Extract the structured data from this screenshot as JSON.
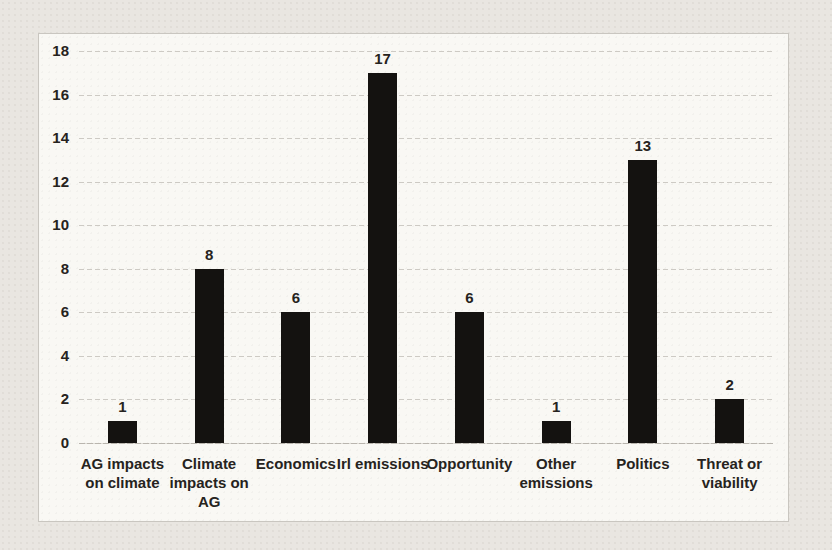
{
  "chart_data": {
    "type": "bar",
    "title": "",
    "xlabel": "",
    "ylabel": "",
    "categories": [
      "AG impacts\non climate",
      "Climate\nimpacts on\nAG",
      "Economics",
      "Irl emissions",
      "Opportunity",
      "Other\nemissions",
      "Politics",
      "Threat or\nviability"
    ],
    "values": [
      1,
      8,
      6,
      17,
      6,
      1,
      13,
      2
    ],
    "data_labels": [
      "1",
      "8",
      "6",
      "17",
      "6",
      "1",
      "13",
      "2"
    ],
    "ylim": [
      0,
      18
    ],
    "ytick_step": 2,
    "yticks": [
      "0",
      "2",
      "4",
      "6",
      "8",
      "10",
      "12",
      "14",
      "16",
      "18"
    ],
    "grid": true,
    "gridline_style": "dashed",
    "legend_position": "none",
    "bar_color": "#141210"
  },
  "colors": {
    "page_background": "#e9e6e1",
    "chart_background": "#f9f8f4",
    "frame_border": "#c9c6c0",
    "gridline": "#cdcac4",
    "text": "#262320",
    "bar": "#141210"
  }
}
